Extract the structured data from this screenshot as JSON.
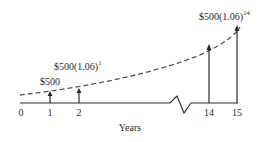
{
  "diagram": {
    "axis_label": "Years",
    "ticks": [
      {
        "label": "0",
        "year": 0
      },
      {
        "label": "1",
        "year": 1
      },
      {
        "label": "2",
        "year": 2
      },
      {
        "label": "14",
        "year": 14
      },
      {
        "label": "15",
        "year": 15
      }
    ],
    "annotations": {
      "year1": "$500",
      "year2_base": "$500(1.06)",
      "year2_exp": "1",
      "year15_base": "$500(1.06)",
      "year15_exp": "14"
    },
    "colors": {
      "line": "#2a2a2a",
      "dashed_curve": "#555555",
      "background": "#ffffff"
    }
  }
}
